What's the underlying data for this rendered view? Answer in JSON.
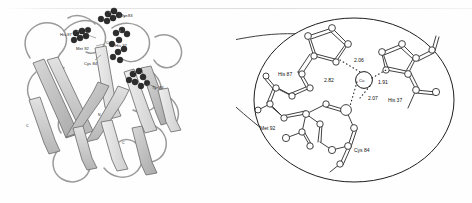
{
  "figure": {
    "caption_present": false,
    "panels": [
      "ribbon-structure",
      "active-site-closeup"
    ]
  },
  "left_panel": {
    "name": "protein-ribbon-diagram",
    "description": "beta-barrel ribbon model with space-filling residue clusters",
    "residue_labels": [
      {
        "id": "label-a",
        "text": "Tyr 83",
        "x": 121,
        "y": 17
      },
      {
        "id": "label-b",
        "text": "His 87",
        "x": 63,
        "y": 36
      },
      {
        "id": "label-c",
        "text": "Met 92",
        "x": 79,
        "y": 50
      },
      {
        "id": "label-d",
        "text": "Cys 84",
        "x": 86,
        "y": 65
      },
      {
        "id": "label-e",
        "text": "Cu",
        "x": 110,
        "y": 44
      },
      {
        "id": "label-f",
        "text": "His 37",
        "x": 118,
        "y": 47
      },
      {
        "id": "label-g",
        "text": "Tyr 83",
        "x": 152,
        "y": 89
      },
      {
        "id": "label-h",
        "text": "C",
        "x": 26,
        "y": 127
      },
      {
        "id": "label-i",
        "text": "N",
        "x": 98,
        "y": 116
      },
      {
        "id": "label-j",
        "text": "C",
        "x": 122,
        "y": 144
      }
    ],
    "colors": {
      "ribbon_fill": "#c8c8c8",
      "ribbon_stroke": "#6e6e6e",
      "atom_cluster": "#2b2b2b",
      "background": "#ffffff"
    }
  },
  "right_panel": {
    "name": "copper-active-site",
    "magnifier": {
      "shape": "circle-with-cone",
      "cone_apex_side": "left"
    },
    "metal": {
      "label": "Cu",
      "element": "copper"
    },
    "ligands": [
      {
        "residue": "His 87",
        "label_x": 57,
        "label_y": 76
      },
      {
        "residue": "His 37",
        "label_x": 158,
        "label_y": 102
      },
      {
        "residue": "Cys 84",
        "label_x": 120,
        "label_y": 150
      },
      {
        "residue": "Met 92",
        "label_x": 38,
        "label_y": 127
      }
    ],
    "bond_distances": [
      {
        "value": "2.06",
        "to": "His 87",
        "x": 125,
        "y": 69
      },
      {
        "value": "2.82",
        "to": "Met 92",
        "x": 100,
        "y": 86
      },
      {
        "value": "1.91",
        "to": "His 37",
        "x": 141,
        "y": 87
      },
      {
        "value": "2.07",
        "to": "Cys 84",
        "x": 135,
        "y": 99
      }
    ],
    "units": "angstrom",
    "colors": {
      "bond_stroke": "#222222",
      "atom_fill": "#ffffff",
      "circle_stroke": "#1e1e1e"
    }
  }
}
